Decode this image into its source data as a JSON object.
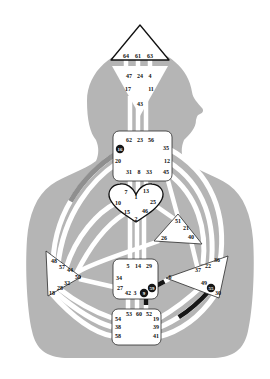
{
  "chart": {
    "type": "human-design-bodygraph",
    "colors": {
      "background": "#ffffff",
      "silhouette": "#b5b5b5",
      "channel": "#ffffff",
      "center_fill": "#ffffff",
      "center_outline": "#2a2a2a",
      "gate_number": "#111111",
      "activated_gate_fill": "#161616",
      "activated_gate_number": "#ffffff",
      "activated_segment_dark": "#161616",
      "activated_segment_gray": "#8f8f8f"
    },
    "centers": {
      "head": {
        "gates": [
          "64",
          "61",
          "63"
        ]
      },
      "ajna": {
        "gates": [
          "47",
          "24",
          "4",
          "17",
          "11",
          "43"
        ]
      },
      "throat": {
        "gates": [
          "62",
          "23",
          "56",
          "35",
          "20",
          "12",
          "31",
          "8",
          "33",
          "45"
        ],
        "activated_gate": "16"
      },
      "g_center": {
        "gates": [
          "7",
          "13",
          "1",
          "10",
          "25",
          "15",
          "46",
          "2"
        ]
      },
      "will": {
        "gates": [
          "51",
          "21",
          "26",
          "40"
        ]
      },
      "spleen": {
        "gates": [
          "48",
          "57",
          "44",
          "50",
          "32",
          "28",
          "18"
        ]
      },
      "sacral": {
        "gates": [
          "5",
          "14",
          "29",
          "34",
          "27",
          "42",
          "3"
        ],
        "activated_gates": [
          "9",
          "59"
        ]
      },
      "solar_plexus": {
        "gates": [
          "36",
          "22",
          "37",
          "6",
          "49",
          "30"
        ],
        "activated_gate": "55"
      },
      "root": {
        "gates": [
          "53",
          "60",
          "52",
          "54",
          "38",
          "58",
          "19",
          "39",
          "41"
        ]
      }
    },
    "activated_gates": [
      "16",
      "9",
      "59",
      "55"
    ]
  }
}
